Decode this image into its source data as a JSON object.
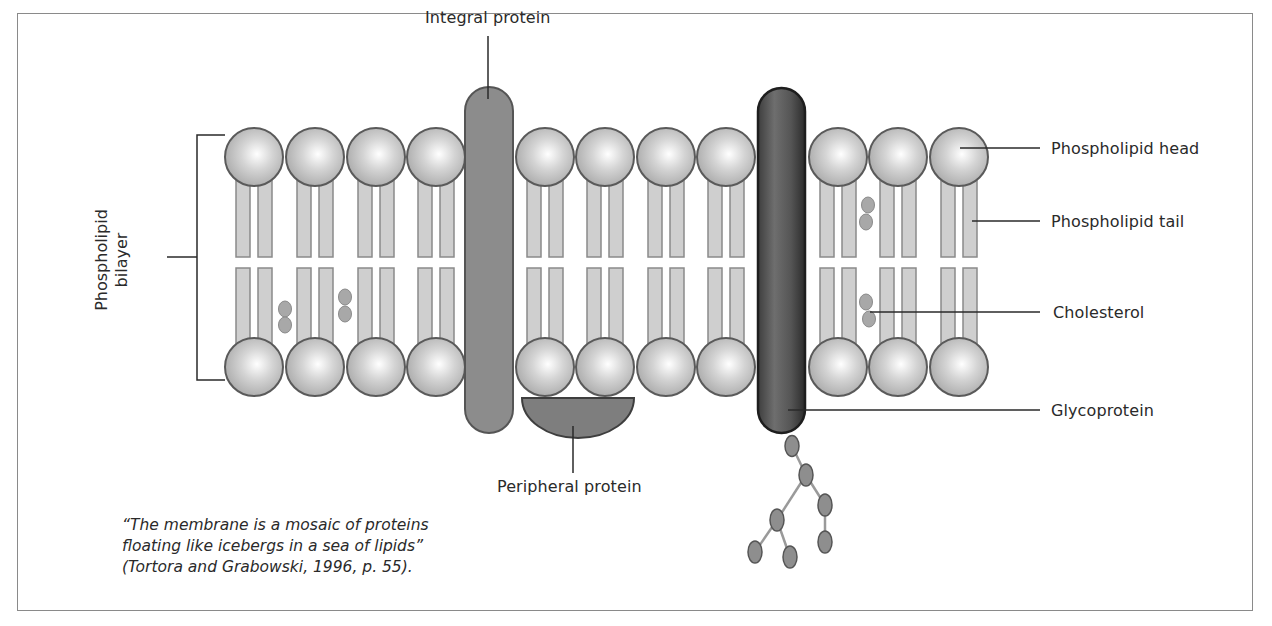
{
  "figure": {
    "labels": {
      "integral_protein": "Integral protein",
      "phospholipid_head": "Phospholipid head",
      "phospholipid_tail": "Phospholipid tail",
      "cholesterol": "Cholesterol",
      "glycoprotein": "Glycoprotein",
      "peripheral_protein": "Peripheral protein",
      "bilayer_line1": "Phospholipid",
      "bilayer_line2": "bilayer"
    },
    "quote": {
      "line1": "“The membrane is a mosaic of proteins",
      "line2": "floating like icebergs in a sea of lipids”",
      "line3": "(Tortora and Grabowski, 1996, p. 55)."
    },
    "colors": {
      "head_fill": "#c4c4c4",
      "head_stroke": "#5a5a5a",
      "tail_fill": "#cfcfcf",
      "tail_stroke": "#8a8a8a",
      "integral_protein": "#8c8c8c",
      "glycoprotein": "#4a4a4a",
      "peripheral_protein": "#7e7e7e",
      "cholesterol": "#a8a8a8",
      "sugar": "#8e8e8e"
    },
    "head_columns_x": [
      254,
      315,
      376,
      436,
      545,
      605,
      666,
      726,
      838,
      898,
      959
    ],
    "head_rows_y": [
      157,
      367
    ],
    "head_radius": 29
  }
}
